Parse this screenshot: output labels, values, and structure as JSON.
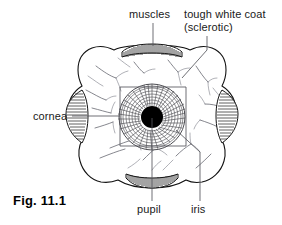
{
  "figure": {
    "caption": "Fig. 11.1",
    "background_color": "#ffffff",
    "ink_color": "#111111",
    "leader_color": "#55565c"
  },
  "labels": {
    "muscles": "muscles",
    "sclerotic_line1": "tough white coat",
    "sclerotic_line2": "(sclerotic)",
    "cornea": "cornea",
    "pupil": "pupil",
    "iris": "iris"
  },
  "diagram": {
    "eyeball": {
      "center_x": 152,
      "center_y": 117,
      "radius_x": 74,
      "radius_y": 66
    },
    "pupil": {
      "center_x": 152,
      "center_y": 117,
      "radius": 11,
      "color": "#000000"
    },
    "iris": {
      "center_x": 152,
      "center_y": 117,
      "radius": 33,
      "ring_count": 9,
      "ray_count": 72
    },
    "muscle_top": {
      "center_x": 152,
      "center_y": 50,
      "half_width": 28
    },
    "muscle_bottom": {
      "center_x": 152,
      "center_y": 184,
      "half_width": 26
    },
    "cornea_left": {
      "center_x": 72,
      "center_y": 117,
      "half_height": 26
    },
    "cornea_right": {
      "center_x": 232,
      "center_y": 117,
      "half_height": 26
    }
  }
}
